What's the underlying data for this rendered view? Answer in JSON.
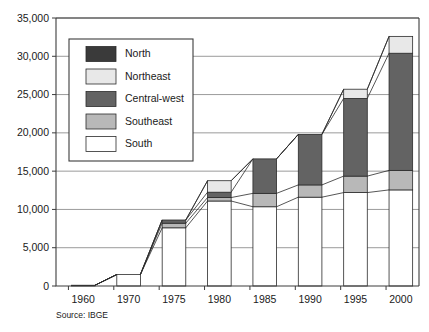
{
  "chart_data": {
    "type": "bar",
    "subtype": "stacked-bar-with-connectors",
    "title": "",
    "xlabel": "",
    "ylabel": "",
    "source": "Source: IBGE",
    "grid": true,
    "legend_position": "upper-left-inside",
    "ylim": [
      0,
      35000
    ],
    "ytick_values": [
      0,
      5000,
      10000,
      15000,
      20000,
      25000,
      30000,
      35000
    ],
    "ytick_labels": [
      "0",
      "5,000",
      "10,000",
      "15,000",
      "20,000",
      "25,000",
      "30,000",
      "35,000"
    ],
    "categories": [
      "1960",
      "1970",
      "1975",
      "1980",
      "1985",
      "1990",
      "1995",
      "2000"
    ],
    "series": [
      {
        "name": "South",
        "color": "#ffffff",
        "values": [
          100,
          1500,
          7600,
          11100,
          10350,
          11600,
          12200,
          12550
        ]
      },
      {
        "name": "Southeast",
        "color": "#b8b8b8",
        "values": [
          0,
          0,
          600,
          450,
          1750,
          1600,
          2150,
          2550
        ]
      },
      {
        "name": "Central-west",
        "color": "#636363",
        "values": [
          0,
          0,
          420,
          700,
          4500,
          6600,
          10150,
          15300
        ]
      },
      {
        "name": "Northeast",
        "color": "#e8e8e8",
        "values": [
          0,
          0,
          0,
          1500,
          0,
          0,
          1200,
          2200
        ]
      },
      {
        "name": "North",
        "color": "#3a3a3a",
        "values": [
          0,
          0,
          0,
          0,
          0,
          0,
          0,
          0
        ]
      }
    ],
    "totals": [
      100,
      1500,
      8620,
      13750,
      16600,
      19800,
      25700,
      32600
    ],
    "legend_order": [
      "North",
      "Northeast",
      "Central-west",
      "Southeast",
      "South"
    ]
  },
  "legend": {
    "items": [
      {
        "label": "North",
        "color": "#3a3a3a"
      },
      {
        "label": "Northeast",
        "color": "#e8e8e8"
      },
      {
        "label": "Central-west",
        "color": "#636363"
      },
      {
        "label": "Southeast",
        "color": "#b8b8b8"
      },
      {
        "label": "South",
        "color": "#ffffff"
      }
    ]
  },
  "footer": {
    "source": "Source: IBGE"
  }
}
